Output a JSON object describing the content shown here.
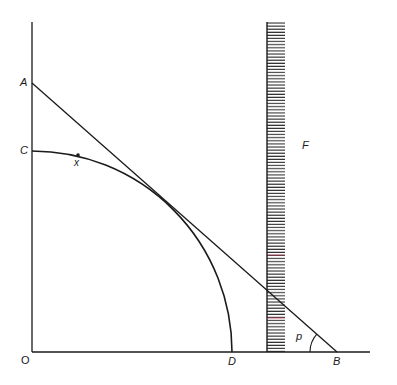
{
  "diagram": {
    "colors": {
      "background": "#ffffff",
      "stroke": "#1a1a1a",
      "hatch": "#2a2a2a",
      "hatch_accent": "#c0304a"
    },
    "labels": {
      "A": "A",
      "C": "C",
      "O": "O",
      "D": "D",
      "B": "B",
      "F": "F",
      "x": "x",
      "p": "p"
    },
    "elements": [
      {
        "id": "y-axis",
        "type": "line",
        "description": "vertical axis from O upward"
      },
      {
        "id": "x-axis",
        "type": "line",
        "description": "horizontal axis from O rightward"
      },
      {
        "id": "line-AB",
        "type": "line",
        "description": "straight line from A on vertical axis to B on horizontal axis"
      },
      {
        "id": "curve-CD",
        "type": "arc",
        "description": "concave curve from C on vertical axis to D on horizontal axis, tangent to AB"
      },
      {
        "id": "point-x",
        "type": "point",
        "description": "point x on curve CD"
      },
      {
        "id": "region-F",
        "type": "hatched-bar",
        "description": "vertical hatched boundary bar labelled F"
      },
      {
        "id": "angle-p",
        "type": "angle",
        "description": "angle p between line AB and horizontal axis at B"
      }
    ]
  }
}
